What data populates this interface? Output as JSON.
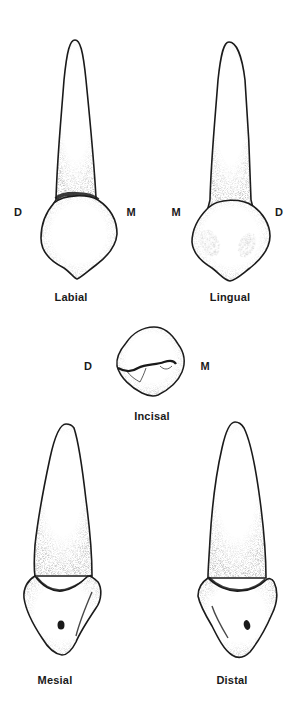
{
  "figure": {
    "colors": {
      "ink": "#1a1a1a",
      "paper": "#ffffff",
      "stipple": "#6b6b6b"
    }
  },
  "views": [
    {
      "id": "labial",
      "label": "Labial",
      "left_dir": "D",
      "right_dir": "M"
    },
    {
      "id": "lingual",
      "label": "Lingual",
      "left_dir": "M",
      "right_dir": "D"
    },
    {
      "id": "incisal",
      "label": "Incisal",
      "left_dir": "D",
      "right_dir": "M"
    },
    {
      "id": "mesial",
      "label": "Mesial"
    },
    {
      "id": "distal",
      "label": "Distal"
    }
  ]
}
